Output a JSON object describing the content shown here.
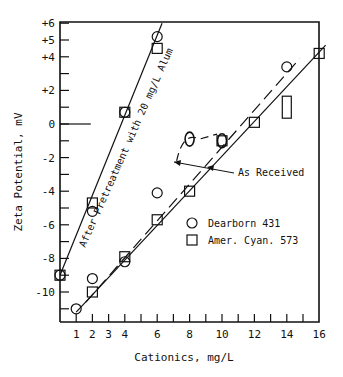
{
  "chart_data": {
    "type": "scatter",
    "title": "",
    "xlabel": "Cationics, mg/L",
    "ylabel": "Zeta Potential, mV",
    "xlim": [
      0,
      16
    ],
    "ylim": [
      -12,
      6
    ],
    "grid": false,
    "x_ticks": [
      1,
      2,
      3,
      4,
      5,
      6,
      7,
      8,
      9,
      10,
      11,
      12,
      13,
      14,
      15,
      16
    ],
    "x_tick_labels": [
      "1",
      "2",
      "3",
      "4",
      "",
      "6",
      "",
      "8",
      "",
      "10",
      "",
      "12",
      "",
      "14",
      "",
      "16"
    ],
    "y_ticks": [
      6,
      5,
      4,
      3,
      2,
      1,
      0,
      -1,
      -2,
      -3,
      -4,
      -5,
      -6,
      -7,
      -8,
      -9,
      -10,
      -11
    ],
    "y_tick_labels": [
      "+6",
      "+5",
      "+4",
      "",
      "+2",
      "",
      "0",
      "",
      "-2",
      "",
      "-4",
      "",
      "-6",
      "",
      "-8",
      "",
      "-10",
      ""
    ],
    "legend": {
      "position": "lower right inside",
      "entries": [
        {
          "marker": "circle",
          "label": "Dearborn 431"
        },
        {
          "marker": "square",
          "label": "Amer. Cyan. 573"
        }
      ]
    },
    "annotations": [
      {
        "text": "After Pretreatment with 20 mg/L Alum",
        "rotation": -66
      },
      {
        "text": "As Received",
        "arrows_to": [
          "dashed line",
          "solid line"
        ]
      }
    ],
    "series": [
      {
        "name": "Dearborn 431 - After Pretreatment with 20 mg/L Alum",
        "marker": "circle",
        "x": [
          0,
          2,
          4,
          6
        ],
        "y": [
          -9.0,
          -5.2,
          0.7,
          5.2
        ]
      },
      {
        "name": "Amer. Cyan. 573 - After Pretreatment with 20 mg/L Alum",
        "marker": "square",
        "x": [
          0,
          2,
          4,
          6
        ],
        "y": [
          -9.0,
          -4.7,
          0.7,
          4.5
        ]
      },
      {
        "name": "Dearborn 431 - As Received",
        "marker": "circle",
        "x": [
          1,
          2,
          4,
          6,
          8,
          10,
          14
        ],
        "y": [
          -11.0,
          -9.2,
          -8.2,
          -4.1,
          -0.9,
          -1.0,
          3.4
        ]
      },
      {
        "name": "Amer. Cyan. 573 - As Received",
        "marker": "square",
        "x": [
          2,
          4,
          6,
          8,
          10,
          12,
          14,
          16
        ],
        "y": [
          -10.0,
          -7.9,
          -5.7,
          -4.0,
          -1.0,
          0.1,
          1.0,
          4.2
        ]
      }
    ],
    "fit_lines": [
      {
        "name": "Alum pretreated fit",
        "style": "solid",
        "from": [
          0,
          -9.0
        ],
        "to": [
          6.3,
          6.0
        ]
      },
      {
        "name": "Dearborn 431 as received fit",
        "style": "dashed",
        "from": [
          1.6,
          -10.6
        ],
        "to": [
          14.8,
          3.9
        ]
      },
      {
        "name": "Amer. Cyan. 573 as received fit",
        "style": "solid",
        "from": [
          1.0,
          -11.2
        ],
        "to": [
          16.4,
          4.7
        ]
      }
    ],
    "zero_line": {
      "from": 0,
      "to": 1.9,
      "y": 0
    }
  },
  "labels": {
    "ylabel": "Zeta Potential, mV",
    "xlabel": "Cationics, mg/L",
    "alum_annotation": "After Pretreatment with 20 mg/L Alum",
    "as_received": "As Received",
    "legend_circle": "Dearborn 431",
    "legend_square": "Amer. Cyan. 573"
  }
}
